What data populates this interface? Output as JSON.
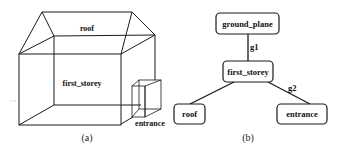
{
  "figure_a": {
    "caption": "(a)",
    "labels": {
      "roof": "roof",
      "first_storey": "first_storey",
      "entrance": "entrance"
    }
  },
  "figure_b": {
    "caption": "(b)",
    "nodes": [
      {
        "id": "ground_plane",
        "label": "ground_plane"
      },
      {
        "id": "first_storey",
        "label": "first_storey"
      },
      {
        "id": "roof",
        "label": "roof"
      },
      {
        "id": "entrance",
        "label": "entrance"
      }
    ],
    "edges": [
      {
        "from": "ground_plane",
        "to": "first_storey",
        "label": "g1"
      },
      {
        "from": "first_storey",
        "to": "roof",
        "label": ""
      },
      {
        "from": "first_storey",
        "to": "entrance",
        "label": "g2"
      }
    ]
  }
}
